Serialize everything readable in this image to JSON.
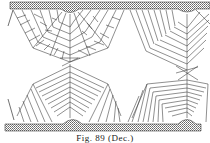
{
  "figure": {
    "caption": "Fig. 89 (Dec.)",
    "line_color": "#333333",
    "plate_fill": "#bdbdbd",
    "background": "#ffffff",
    "parts": [
      "top-plate",
      "bottom-plate",
      "upper-left-brick-fan",
      "upper-right-line-fan",
      "lower-left-chevron-fan",
      "lower-right-chevron-fan"
    ]
  }
}
